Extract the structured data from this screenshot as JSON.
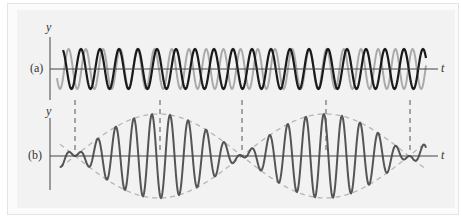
{
  "figure": {
    "panels": [
      {
        "id": "a",
        "label": "(a)",
        "y_label": "y",
        "t_label": "t",
        "axis_y": 69,
        "y_axis_top": 37,
        "y_axis_bottom": 100,
        "waves": [
          {
            "name": "wave-1",
            "color": "#aaaaaa",
            "width": 2.0,
            "amplitude": 20,
            "period": 17.2,
            "phase_x": 60,
            "start": 57,
            "end": 426,
            "phase": -1.5708
          },
          {
            "name": "wave-2",
            "color": "#1a1a1a",
            "width": 2.2,
            "amplitude": 20,
            "period": 19.0,
            "phase_x": 62,
            "start": 63,
            "end": 426,
            "phase": 1.5708
          }
        ]
      },
      {
        "id": "b",
        "label": "(b)",
        "y_label": "y",
        "t_label": "t",
        "axis_y": 156,
        "y_axis_top": 118,
        "y_axis_bottom": 190,
        "superposition": {
          "color": "#555555",
          "width": 2.0,
          "amplitude": 42,
          "carrier_period": 18.1,
          "beat_period": 334,
          "node_x": 75,
          "start": 60,
          "end": 426
        },
        "envelope": {
          "color": "#b5b5b5",
          "dash": "5,4"
        }
      }
    ],
    "axis": {
      "x_start": 50,
      "x_end": 438,
      "y_axis_x": 50,
      "color": "#444444"
    },
    "dashed_markers": {
      "x": [
        75,
        160,
        242,
        326,
        410
      ],
      "y_top": 100,
      "y_bottom": 150,
      "color": "#555555",
      "dash": "5,4"
    }
  }
}
